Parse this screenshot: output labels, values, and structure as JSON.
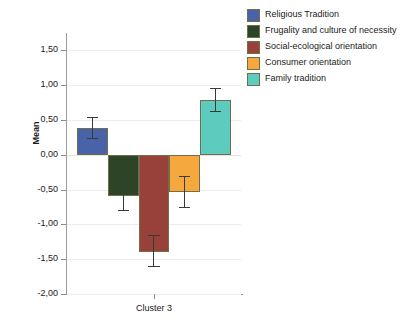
{
  "chart_data": {
    "type": "bar",
    "title": "",
    "subtitle": "",
    "xlabel": "",
    "ylabel": "Mean",
    "categories": [
      "Cluster 3"
    ],
    "ylim": [
      -2.0,
      1.75
    ],
    "ytick_values": [
      1.5,
      1.0,
      0.5,
      0.0,
      -0.5,
      -1.0,
      -1.5,
      -2.0
    ],
    "ytick_labels": [
      "1,50",
      "1,00",
      "0,50",
      "0,00",
      "-0,50",
      "-1,00",
      "-1,50",
      "-2,00"
    ],
    "grid": true,
    "legend_position": "right",
    "error_bars": true,
    "decimal_separator": ",",
    "series": [
      {
        "name": "Religious Tradition",
        "color": "#4A62A8",
        "values": [
          0.38
        ],
        "error_low": [
          0.22
        ],
        "error_high": [
          0.55
        ]
      },
      {
        "name": "Frugality and culture of necessity",
        "color": "#2D4427",
        "values": [
          -0.59
        ],
        "error_low": [
          -0.81
        ],
        "error_high": [
          -0.4
        ]
      },
      {
        "name": "Social-ecological orientation",
        "color": "#98403A",
        "values": [
          -1.39
        ],
        "error_low": [
          -1.61
        ],
        "error_high": [
          -1.15
        ]
      },
      {
        "name": "Consumer orientation",
        "color": "#F5A83E",
        "values": [
          -0.54
        ],
        "error_low": [
          -0.76
        ],
        "error_high": [
          -0.3
        ]
      },
      {
        "name": "Family tradition",
        "color": "#5ECBBF",
        "values": [
          0.79
        ],
        "error_low": [
          0.62
        ],
        "error_high": [
          0.96
        ]
      }
    ]
  },
  "axis": {
    "y_title": "Mean"
  },
  "legend": {
    "entries": [
      {
        "label": "Religious Tradition",
        "color": "#4A62A8"
      },
      {
        "label": "Frugality and culture of necessity",
        "color": "#2D4427"
      },
      {
        "label": "Social-ecological orientation",
        "color": "#98403A"
      },
      {
        "label": "Consumer orientation",
        "color": "#F5A83E"
      },
      {
        "label": "Family tradition",
        "color": "#5ECBBF"
      }
    ]
  }
}
